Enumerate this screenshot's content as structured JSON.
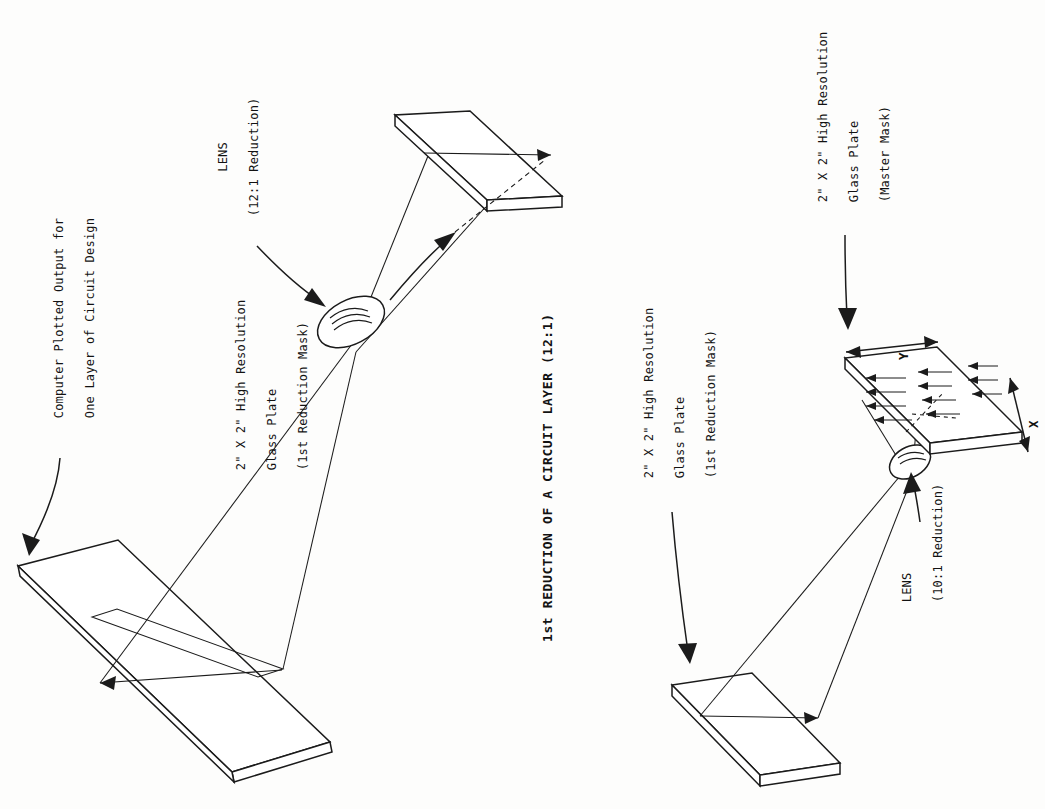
{
  "figure": {
    "title": "1st REDUCTION OF A CIRCUIT LAYER (12:1)",
    "orientation_note": "rotated-90-ccw"
  },
  "labels": {
    "plot_output": {
      "line1": "Computer Plotted Output for",
      "line2": "One Layer of Circuit Design"
    },
    "lens_top": {
      "line1": "LENS",
      "line2": "(12:1 Reduction)"
    },
    "plate_first_reduction_top": {
      "line1": "2\" X 2\" High Resolution",
      "line2": "Glass Plate",
      "line3": "(1st Reduction Mask)"
    },
    "plate_first_reduction_bottom": {
      "line1": "2\" X 2\" High Resolution",
      "line2": "Glass Plate",
      "line3": "(1st Reduction Mask)"
    },
    "plate_master_mask": {
      "line1": "2\" X 2\" High Resolution",
      "line2": "Glass Plate",
      "line3": "(Master Mask)"
    },
    "lens_bottom": {
      "line1": "LENS",
      "line2": "(10:1 Reduction)"
    },
    "axis_x": "X",
    "axis_y": "Y"
  },
  "colors": {
    "ink": "#1b1b1b",
    "paper": "#fdfdfc"
  }
}
